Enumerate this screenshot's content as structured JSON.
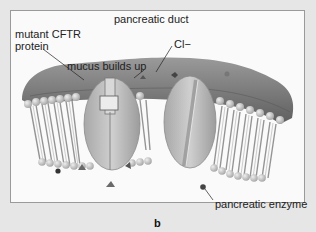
{
  "figure": {
    "panel_letter": "b",
    "style": "grayscale",
    "labels": {
      "duct": "pancreatic duct",
      "mutant_protein_line1": "mutant CFTR",
      "mutant_protein_line2": "protein",
      "mucus": "mucus builds up",
      "chloride": "Cl−",
      "enzyme": "pancreatic enzyme"
    },
    "colors": {
      "background": "#e6e6e6",
      "frame": "#fafafa",
      "frame_border": "#9a9a9a",
      "mucus_layer": "#8c8c8c",
      "lipid_head": "#c8c8c8",
      "lipid_tail": "#8a8a8a",
      "protein": "#bdbdbd",
      "particle_triangle": "#6a6a6a",
      "particle_enzyme": "#444444",
      "text": "#222222"
    }
  }
}
